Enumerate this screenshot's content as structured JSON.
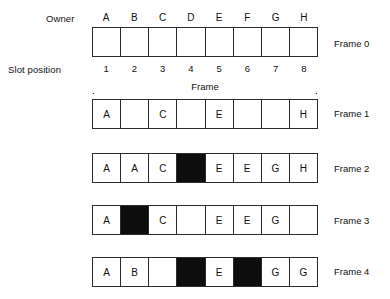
{
  "labels": {
    "owner": "Owner",
    "slot_position": "Slot position",
    "frame_span": "Frame"
  },
  "owners": [
    "A",
    "B",
    "C",
    "D",
    "E",
    "F",
    "G",
    "H"
  ],
  "slot_numbers": [
    "1",
    "2",
    "3",
    "4",
    "5",
    "6",
    "7",
    "8"
  ],
  "colors": {
    "line": "#2b2b2b",
    "filled": "#0d0d0d",
    "background": "#ffffff",
    "text": "#111111"
  },
  "frames": [
    {
      "caption": "Frame 0",
      "cells": [
        {
          "label": "",
          "filled": false
        },
        {
          "label": "",
          "filled": false
        },
        {
          "label": "",
          "filled": false
        },
        {
          "label": "",
          "filled": false
        },
        {
          "label": "",
          "filled": false
        },
        {
          "label": "",
          "filled": false
        },
        {
          "label": "",
          "filled": false
        },
        {
          "label": "",
          "filled": false
        }
      ]
    },
    {
      "caption": "Frame 1",
      "cells": [
        {
          "label": "A",
          "filled": false
        },
        {
          "label": "",
          "filled": false
        },
        {
          "label": "C",
          "filled": false
        },
        {
          "label": "",
          "filled": false
        },
        {
          "label": "E",
          "filled": false
        },
        {
          "label": "",
          "filled": false
        },
        {
          "label": "",
          "filled": false
        },
        {
          "label": "H",
          "filled": false
        }
      ]
    },
    {
      "caption": "Frame 2",
      "cells": [
        {
          "label": "A",
          "filled": false
        },
        {
          "label": "A",
          "filled": false
        },
        {
          "label": "C",
          "filled": false
        },
        {
          "label": "",
          "filled": true
        },
        {
          "label": "E",
          "filled": false
        },
        {
          "label": "E",
          "filled": false
        },
        {
          "label": "G",
          "filled": false
        },
        {
          "label": "H",
          "filled": false
        }
      ]
    },
    {
      "caption": "Frame 3",
      "cells": [
        {
          "label": "A",
          "filled": false
        },
        {
          "label": "",
          "filled": true
        },
        {
          "label": "C",
          "filled": false
        },
        {
          "label": "",
          "filled": false
        },
        {
          "label": "E",
          "filled": false
        },
        {
          "label": "E",
          "filled": false
        },
        {
          "label": "G",
          "filled": false
        },
        {
          "label": "",
          "filled": false
        }
      ]
    },
    {
      "caption": "Frame 4",
      "cells": [
        {
          "label": "A",
          "filled": false
        },
        {
          "label": "B",
          "filled": false
        },
        {
          "label": "",
          "filled": false
        },
        {
          "label": "",
          "filled": true
        },
        {
          "label": "E",
          "filled": false
        },
        {
          "label": "",
          "filled": true
        },
        {
          "label": "G",
          "filled": false
        },
        {
          "label": "G",
          "filled": false
        }
      ]
    }
  ]
}
